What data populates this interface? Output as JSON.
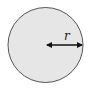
{
  "diagram": {
    "shape": "circle",
    "fill_color": "#e6e6e6",
    "stroke_color": "#555555",
    "radius_label": "r",
    "arrow": {
      "type": "double-headed",
      "from": "center",
      "to": "right-edge",
      "color": "#111111"
    }
  }
}
